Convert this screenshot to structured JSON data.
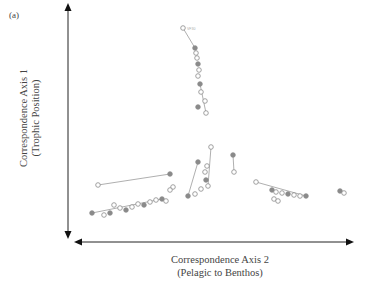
{
  "chart_data": {
    "type": "scatter",
    "panel_label": "(a)",
    "title": "",
    "ylabel": "Correspondence Axis 1",
    "ylabel_sub": "(Trophic Position)",
    "xlabel": "Correspondence Axis 2",
    "xlabel_sub": "(Pelagic to Benthos)",
    "grid": false,
    "legend": null,
    "axes_style": "double-headed arrows without ticks",
    "groups": [
      {
        "name": "vertical cluster (high trophic)",
        "points": [
          {
            "x": 183,
            "y": 28,
            "label": "VF30"
          },
          {
            "x": 195,
            "y": 48
          },
          {
            "x": 196,
            "y": 53
          },
          {
            "x": 197,
            "y": 58
          },
          {
            "x": 198,
            "y": 64
          },
          {
            "x": 199,
            "y": 70
          },
          {
            "x": 198,
            "y": 76
          },
          {
            "x": 200,
            "y": 84
          },
          {
            "x": 201,
            "y": 92
          },
          {
            "x": 205,
            "y": 101
          },
          {
            "x": 198,
            "y": 107
          },
          {
            "x": 206,
            "y": 113
          }
        ]
      },
      {
        "name": "central cluster",
        "points": [
          {
            "x": 211,
            "y": 147
          },
          {
            "x": 198,
            "y": 162
          },
          {
            "x": 207,
            "y": 166
          },
          {
            "x": 205,
            "y": 172
          },
          {
            "x": 206,
            "y": 180
          },
          {
            "x": 208,
            "y": 186
          },
          {
            "x": 201,
            "y": 189
          },
          {
            "x": 233,
            "y": 155
          },
          {
            "x": 234,
            "y": 172
          },
          {
            "x": 195,
            "y": 194
          },
          {
            "x": 188,
            "y": 196
          }
        ]
      },
      {
        "name": "left cluster (pelagic)",
        "points": [
          {
            "x": 98,
            "y": 185
          },
          {
            "x": 170,
            "y": 174
          },
          {
            "x": 173,
            "y": 187
          },
          {
            "x": 170,
            "y": 190
          },
          {
            "x": 92,
            "y": 213
          },
          {
            "x": 114,
            "y": 205
          },
          {
            "x": 120,
            "y": 208
          },
          {
            "x": 126,
            "y": 210
          },
          {
            "x": 132,
            "y": 207
          },
          {
            "x": 138,
            "y": 204
          },
          {
            "x": 144,
            "y": 205
          },
          {
            "x": 150,
            "y": 202
          },
          {
            "x": 156,
            "y": 200
          },
          {
            "x": 162,
            "y": 199
          },
          {
            "x": 166,
            "y": 201
          },
          {
            "x": 104,
            "y": 215
          },
          {
            "x": 110,
            "y": 213
          }
        ]
      },
      {
        "name": "right cluster (benthic)",
        "points": [
          {
            "x": 256,
            "y": 182
          },
          {
            "x": 272,
            "y": 190
          },
          {
            "x": 276,
            "y": 192
          },
          {
            "x": 282,
            "y": 193
          },
          {
            "x": 288,
            "y": 194
          },
          {
            "x": 294,
            "y": 195
          },
          {
            "x": 300,
            "y": 196
          },
          {
            "x": 306,
            "y": 196
          },
          {
            "x": 274,
            "y": 199
          },
          {
            "x": 278,
            "y": 201
          },
          {
            "x": 340,
            "y": 191
          },
          {
            "x": 344,
            "y": 193
          }
        ]
      }
    ],
    "connecting_lines": [
      [
        [
          183,
          28
        ],
        [
          195,
          48
        ]
      ],
      [
        [
          98,
          185
        ],
        [
          170,
          174
        ]
      ],
      [
        [
          92,
          213
        ],
        [
          162,
          199
        ]
      ],
      [
        [
          256,
          182
        ],
        [
          306,
          196
        ]
      ],
      [
        [
          211,
          147
        ],
        [
          208,
          186
        ]
      ],
      [
        [
          233,
          155
        ],
        [
          234,
          172
        ]
      ],
      [
        [
          198,
          162
        ],
        [
          188,
          196
        ]
      ],
      [
        [
          200,
          84
        ],
        [
          206,
          113
        ]
      ],
      [
        [
          340,
          191
        ],
        [
          344,
          193
        ]
      ]
    ]
  }
}
